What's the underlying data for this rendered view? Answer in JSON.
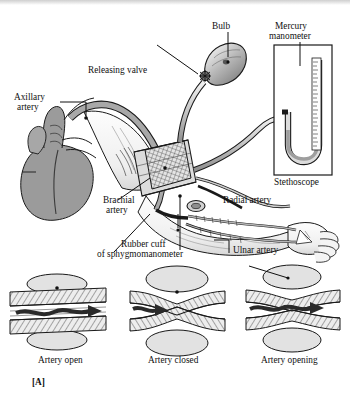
{
  "figure": {
    "panel_label": "[A]",
    "type": "anatomical-diagram"
  },
  "labels": {
    "bulb": "Bulb",
    "mercury_manometer_line1": "Mercury",
    "mercury_manometer_line2": "manometer",
    "releasing_valve": "Releasing valve",
    "axillary_artery_line1": "Axillary",
    "axillary_artery_line2": "artery",
    "brachial_artery_line1": "Brachial",
    "brachial_artery_line2": "artery",
    "radial_artery": "Radial artery",
    "ulnar_artery": "Ulnar artery",
    "stethoscope": "Stethoscope",
    "rubber_cuff_line1": "Rubber cuff",
    "rubber_cuff_line2": "of sphygmomanometer"
  },
  "states": [
    {
      "caption": "Artery open",
      "description": "lumen fully patent, blood flows freely"
    },
    {
      "caption": "Artery closed",
      "description": "cuff pressure occludes the vessel, flow stops"
    },
    {
      "caption": "Artery opening",
      "description": "partially patent lumen, turbulent flow resumes"
    }
  ],
  "colors": {
    "ink": "#101010",
    "vessel_fill": "#9b9b9b",
    "tissue_fill": "#d6d6d6",
    "pad_fill": "#e2e2e2",
    "hatch": "#5e5e5e",
    "paper": "#ffffff"
  }
}
